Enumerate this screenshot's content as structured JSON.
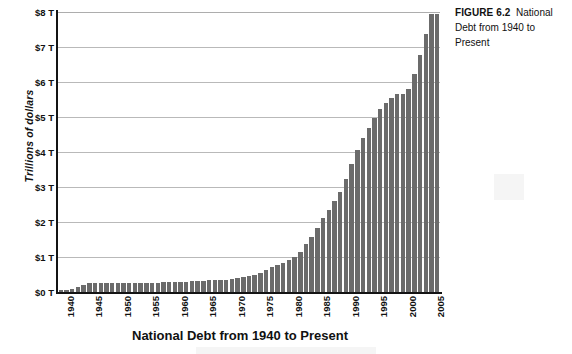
{
  "caption": {
    "label": "FIGURE 6.2",
    "text": "National Debt from 1940 to Present"
  },
  "chart_data": {
    "type": "bar",
    "title": "National Debt from 1940 to Present",
    "xlabel": "",
    "ylabel": "Trillions of dollars",
    "ylim": [
      0,
      8
    ],
    "grid": true,
    "legend": "none",
    "bar_color": "#6b6b6b",
    "y_tick_labels": [
      "$0 T",
      "$1 T",
      "$2 T",
      "$3 T",
      "$4 T",
      "$5 T",
      "$6 T",
      "$7 T",
      "$8 T"
    ],
    "y_tick_values": [
      0,
      1,
      2,
      3,
      4,
      5,
      6,
      7,
      8
    ],
    "x_tick_labels": [
      "1940",
      "1945",
      "1950",
      "1955",
      "1960",
      "1965",
      "1970",
      "1975",
      "1980",
      "1985",
      "1990",
      "1995",
      "2000",
      "2005"
    ],
    "x_tick_values": [
      1940,
      1945,
      1950,
      1955,
      1960,
      1965,
      1970,
      1975,
      1980,
      1985,
      1990,
      1995,
      2000,
      2005
    ],
    "categories": [
      1940,
      1941,
      1942,
      1943,
      1944,
      1945,
      1946,
      1947,
      1948,
      1949,
      1950,
      1951,
      1952,
      1953,
      1954,
      1955,
      1956,
      1957,
      1958,
      1959,
      1960,
      1961,
      1962,
      1963,
      1964,
      1965,
      1966,
      1967,
      1968,
      1969,
      1970,
      1971,
      1972,
      1973,
      1974,
      1975,
      1976,
      1977,
      1978,
      1979,
      1980,
      1981,
      1982,
      1983,
      1984,
      1985,
      1986,
      1987,
      1988,
      1989,
      1990,
      1991,
      1992,
      1993,
      1994,
      1995,
      1996,
      1997,
      1998,
      1999,
      2000,
      2001,
      2002,
      2003,
      2004,
      2005,
      2006
    ],
    "values": [
      0.05,
      0.06,
      0.08,
      0.14,
      0.2,
      0.26,
      0.27,
      0.26,
      0.25,
      0.25,
      0.26,
      0.26,
      0.26,
      0.27,
      0.27,
      0.27,
      0.27,
      0.27,
      0.28,
      0.29,
      0.29,
      0.29,
      0.3,
      0.31,
      0.32,
      0.32,
      0.33,
      0.34,
      0.35,
      0.35,
      0.37,
      0.41,
      0.44,
      0.47,
      0.48,
      0.54,
      0.63,
      0.71,
      0.78,
      0.83,
      0.91,
      1.0,
      1.14,
      1.37,
      1.56,
      1.82,
      2.12,
      2.35,
      2.6,
      2.87,
      3.23,
      3.67,
      4.06,
      4.41,
      4.69,
      4.97,
      5.22,
      5.41,
      5.53,
      5.66,
      5.67,
      5.81,
      6.23,
      6.78,
      7.38,
      7.93,
      7.95
    ]
  }
}
